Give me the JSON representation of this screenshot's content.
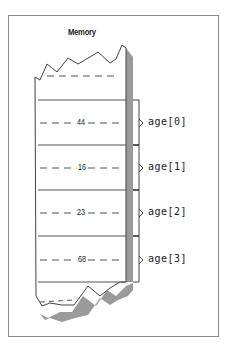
{
  "diagram": {
    "title": "Memory",
    "cells": [
      {
        "value": "44",
        "label": "age[0]"
      },
      {
        "value": "16",
        "label": "age[1]"
      },
      {
        "value": "23",
        "label": "age[2]"
      },
      {
        "value": "68",
        "label": "age[3]"
      }
    ],
    "colors": {
      "line": "#555555",
      "shadow": "#9a9a9a",
      "frame": "#8a8a8a"
    }
  }
}
